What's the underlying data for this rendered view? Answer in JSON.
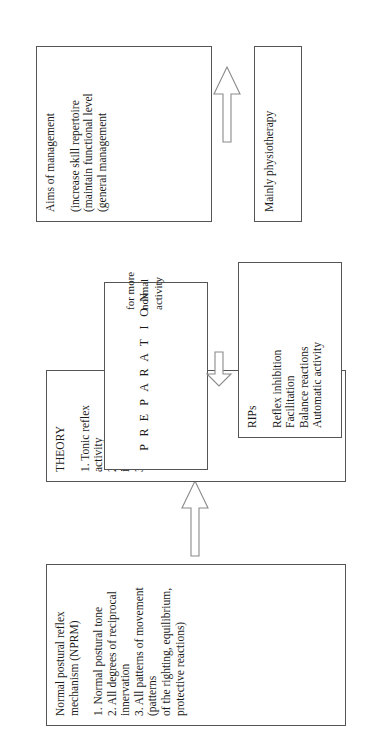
{
  "diagram": {
    "type": "flowchart",
    "orientation": "rotated-90-ccw",
    "sections": [
      {
        "id": "theory-section",
        "source": {
          "title": "Normal postural reflex\nmechanism (NPRM)",
          "items": [
            "1.  Normal postural tone",
            "2.  All degrees of reciprocal innervation",
            "3.  All patterns of movement (patterns\n     of the righting, equilibrium,\n     protective reactions)"
          ]
        },
        "target": {
          "title": "THEORY",
          "items": [
            "1.  Tonic reflex activity",
            "2.  Dynamic interacting systems",
            "3.  Feedback"
          ]
        },
        "arrow_direction": "right"
      },
      {
        "id": "preparation-section",
        "acronym": [
          "P",
          "R",
          "E",
          "P",
          "A",
          "R",
          "A",
          "T",
          "I",
          "O",
          "N"
        ],
        "acronym_word": "PREPARATION",
        "purpose": "for more\nnormal\nactivity",
        "target": {
          "title": "RIPs",
          "items": [
            "Reflex inhibition",
            "Facilitation",
            "Balance reactions",
            "Automatic activity"
          ]
        },
        "arrow_direction": "left"
      },
      {
        "id": "aims-section",
        "source": {
          "title": "Aims of management",
          "items": [
            "(increase skill repertoire",
            "(maintain functional level",
            "(general management"
          ]
        },
        "target": {
          "title": "Mainly physiotherapy"
        },
        "arrow_direction": "right"
      }
    ]
  },
  "style": {
    "background": "#ffffff",
    "box_border": "#555555",
    "arrow_outline": "#8a8a8a",
    "text": "#1a1a1a"
  }
}
